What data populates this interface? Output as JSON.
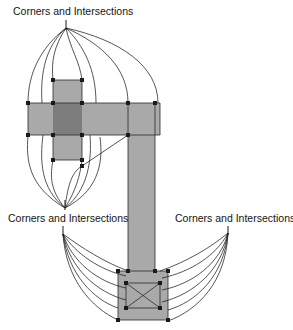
{
  "figure": {
    "title": "Corners and Intersections",
    "background_color": "#ffffff",
    "stroke_color": "#141414",
    "fill_light": "#a8a8a8",
    "fill_dark": "#7d7d7d",
    "marker_color": "#1a1a1a",
    "width": 293,
    "height": 330
  },
  "labels": [
    {
      "id": "top-label",
      "text": "Corners and Intersections",
      "x": 13,
      "y": 15,
      "anchor": "start"
    },
    {
      "id": "bottom-left-label",
      "text": "Corners and Intersections",
      "x": 8,
      "y": 222,
      "anchor": "start"
    },
    {
      "id": "bottom-right-label",
      "text": "Corners and Intersections",
      "x": 175,
      "y": 222,
      "anchor": "start"
    }
  ],
  "convergence_points": [
    {
      "id": "top-hub",
      "x": 66,
      "y": 28
    },
    {
      "id": "middle-hub",
      "x": 65,
      "y": 208
    },
    {
      "id": "bottom-left-hub",
      "x": 63,
      "y": 234
    },
    {
      "id": "bottom-right-hub",
      "x": 228,
      "y": 233
    }
  ],
  "shapes": {
    "small_vertical_bar": {
      "x": 53,
      "y": 80,
      "w": 29,
      "h": 80,
      "fill": "fill_light"
    },
    "horizontal_bar": {
      "x": 28,
      "y": 103,
      "w": 132,
      "h": 32,
      "fill": "fill_light"
    },
    "cross_overlap": {
      "x": 53,
      "y": 103,
      "w": 29,
      "h": 32,
      "fill": "fill_dark"
    },
    "long_vertical_bar": {
      "x": 128,
      "y": 103,
      "w": 27,
      "h": 170,
      "fill": "fill_light"
    },
    "bottom_square": {
      "x": 118,
      "y": 271,
      "w": 50,
      "h": 49,
      "fill": "fill_light"
    },
    "diagonal_line": {
      "x1": 128,
      "y1": 135,
      "x2": 82,
      "y2": 166
    }
  },
  "corner_markers": [
    {
      "id": "m1",
      "x": 53,
      "y": 80
    },
    {
      "id": "m2",
      "x": 82,
      "y": 80
    },
    {
      "id": "m3",
      "x": 28,
      "y": 103
    },
    {
      "id": "m4",
      "x": 53,
      "y": 103
    },
    {
      "id": "m5",
      "x": 82,
      "y": 103
    },
    {
      "id": "m6",
      "x": 128,
      "y": 103
    },
    {
      "id": "m7",
      "x": 155,
      "y": 103
    },
    {
      "id": "m8",
      "x": 28,
      "y": 135
    },
    {
      "id": "m9",
      "x": 53,
      "y": 135
    },
    {
      "id": "m10",
      "x": 82,
      "y": 135
    },
    {
      "id": "m11",
      "x": 128,
      "y": 135
    },
    {
      "id": "m12",
      "x": 53,
      "y": 160
    },
    {
      "id": "m13",
      "x": 82,
      "y": 160
    },
    {
      "id": "m14",
      "x": 128,
      "y": 271
    },
    {
      "id": "m15",
      "x": 155,
      "y": 271
    },
    {
      "id": "m16",
      "x": 118,
      "y": 271
    },
    {
      "id": "m17",
      "x": 168,
      "y": 271
    },
    {
      "id": "m18",
      "x": 126,
      "y": 283
    },
    {
      "id": "m19",
      "x": 160,
      "y": 283
    },
    {
      "id": "m20",
      "x": 126,
      "y": 308
    },
    {
      "id": "m21",
      "x": 160,
      "y": 308
    },
    {
      "id": "m22",
      "x": 118,
      "y": 320
    },
    {
      "id": "m23",
      "x": 168,
      "y": 320
    }
  ],
  "leader_lines": {
    "top_group_count": 7,
    "middle_group_count": 7,
    "bottom_left_group_count": 6,
    "bottom_right_group_count": 6
  },
  "inner_x_marks": [
    {
      "x1": 126,
      "y1": 283,
      "x2": 160,
      "y2": 308
    },
    {
      "x1": 160,
      "y1": 283,
      "x2": 126,
      "y2": 308
    }
  ]
}
